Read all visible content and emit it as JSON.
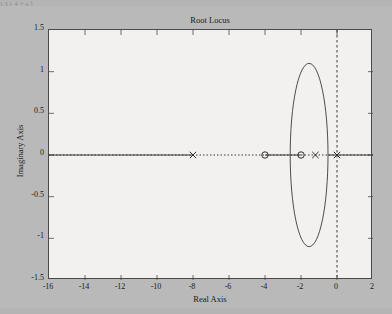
{
  "page": {
    "bleed_text": ")3(4+s)",
    "background_color": "#b9b9b9",
    "axes_color": "#f2f1ef"
  },
  "chart_data": {
    "type": "line",
    "title": "Root Locus",
    "xlabel": "Real Axis",
    "ylabel": "Imaginary Axis",
    "xlim": [
      -16,
      2
    ],
    "ylim": [
      -1.5,
      1.5
    ],
    "xticks": [
      -16,
      -14,
      -12,
      -10,
      -8,
      -6,
      -4,
      -2,
      0,
      2
    ],
    "xticklabels": [
      "-16",
      "-14",
      "-12",
      "-10",
      "-8",
      "-6",
      "-4",
      "-2",
      "0",
      "2"
    ],
    "yticks": [
      1.5,
      1,
      0.5,
      0,
      -0.5,
      -1,
      -1.5
    ],
    "yticklabels": [
      "1.5",
      "1",
      "0.5",
      "0",
      "-0.5",
      "-1",
      "-1.5"
    ],
    "grid": false,
    "legend": null,
    "series": [
      {
        "name": "real-axis-locus-left",
        "style": "solid",
        "color": "#3a3a3a",
        "points": [
          [
            -16,
            0
          ],
          [
            -8,
            0
          ]
        ]
      },
      {
        "name": "real-axis-locus-center",
        "style": "solid",
        "color": "#3a3a3a",
        "points": [
          [
            -4,
            0
          ],
          [
            -2,
            0
          ]
        ]
      },
      {
        "name": "real-axis-locus-right",
        "style": "solid",
        "color": "#3a3a3a",
        "points": [
          [
            -0.5,
            0
          ],
          [
            2,
            0
          ]
        ]
      },
      {
        "name": "complex-locus-ellipse",
        "style": "solid",
        "color": "#3a3a3a",
        "shape": "ellipse",
        "center": [
          -1.55,
          0
        ],
        "semi_axis_x": 1.05,
        "semi_axis_y": 1.1
      }
    ],
    "reference_lines": [
      {
        "name": "real-axis-dotted",
        "orientation": "horizontal",
        "value": 0,
        "style": "dotted",
        "color": "#3a3a3a"
      },
      {
        "name": "imaginary-axis-dotted",
        "orientation": "vertical",
        "value": 0,
        "style": "dashed",
        "color": "#3a3a3a"
      }
    ],
    "markers": [
      {
        "name": "open-loop-pole",
        "symbol": "x",
        "x": -8,
        "y": 0
      },
      {
        "name": "open-loop-zero",
        "symbol": "o",
        "x": -4,
        "y": 0
      },
      {
        "name": "open-loop-zero",
        "symbol": "o",
        "x": -2,
        "y": 0
      },
      {
        "name": "open-loop-pole",
        "symbol": "x",
        "x": -1.2,
        "y": 0
      },
      {
        "name": "open-loop-pole",
        "symbol": "x",
        "x": 0,
        "y": 0
      }
    ]
  }
}
